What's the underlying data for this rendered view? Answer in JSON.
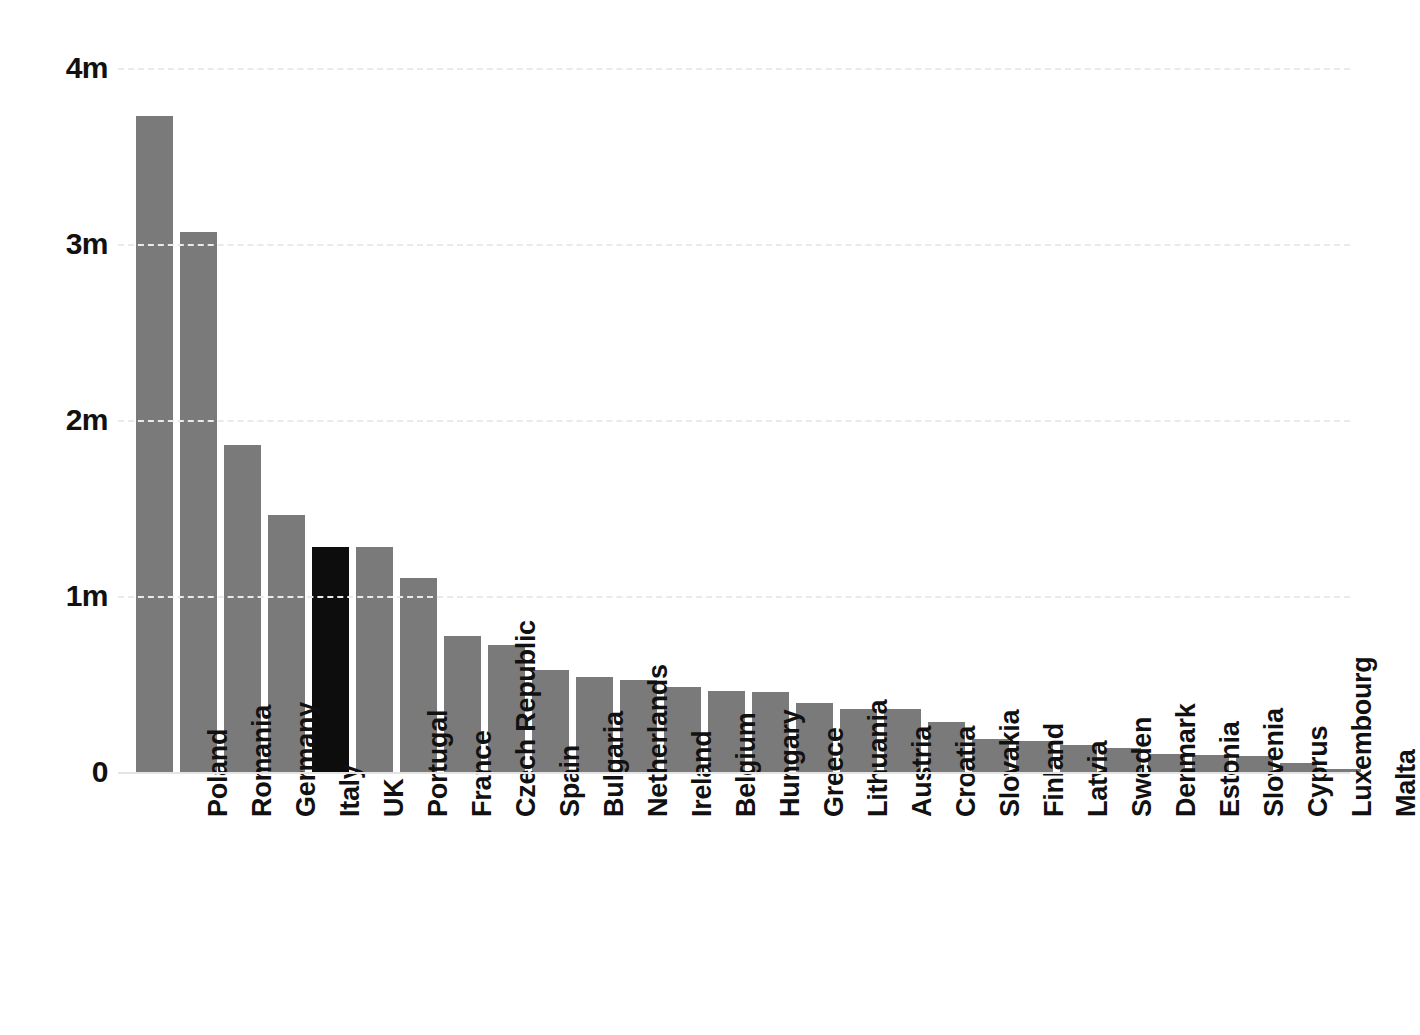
{
  "chart_data": {
    "type": "bar",
    "title": "",
    "subtitle": "",
    "xlabel": "",
    "ylabel": "",
    "ylim": [
      0,
      4000000
    ],
    "grid": true,
    "legend": false,
    "y_ticks": [
      {
        "value": 0,
        "label": "0"
      },
      {
        "value": 1000000,
        "label": "1m"
      },
      {
        "value": 2000000,
        "label": "2m"
      },
      {
        "value": 3000000,
        "label": "3m"
      },
      {
        "value": 4000000,
        "label": "4m"
      }
    ],
    "colors": {
      "bar": "#7a7a7a",
      "highlight_bar": "#0d0d0d",
      "gridline": "#eaeaea",
      "axis_text": "#111111",
      "background": "#ffffff"
    },
    "highlight_category": "UK",
    "categories": [
      "Poland",
      "Romania",
      "Germany",
      "Italy",
      "UK",
      "Portugal",
      "France",
      "Czech Republic",
      "Spain",
      "Bulgaria",
      "Netherlands",
      "Ireland",
      "Belgium",
      "Hungary",
      "Greece",
      "Lithuania",
      "Austria",
      "Croatia",
      "Slovakia",
      "Finland",
      "Latvia",
      "Sweden",
      "Denmark",
      "Estonia",
      "Slovenia",
      "Cyprus",
      "Luxembourg",
      "Malta"
    ],
    "values": [
      3730000,
      3070000,
      1860000,
      1460000,
      1280000,
      1280000,
      1100000,
      770000,
      720000,
      580000,
      540000,
      520000,
      485000,
      460000,
      455000,
      390000,
      360000,
      358000,
      285000,
      190000,
      175000,
      155000,
      135000,
      100000,
      95000,
      92000,
      50000,
      15000
    ]
  }
}
